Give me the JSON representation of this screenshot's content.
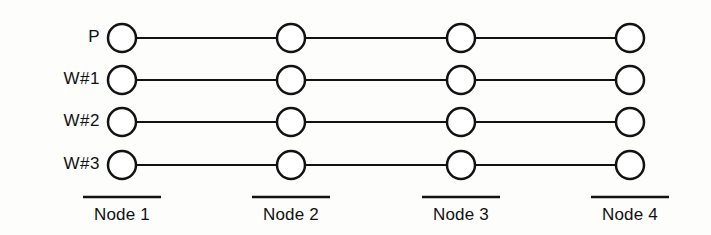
{
  "diagram": {
    "type": "timeline-lanes",
    "background_color": "#fdfdfb",
    "stroke_color": "#121212",
    "node_fill_color": "#ffffff",
    "geometry": {
      "circle_radius": 14,
      "column_x": [
        122,
        291,
        461,
        630
      ],
      "row_y": [
        38,
        80,
        122,
        165
      ],
      "rule_y": 197,
      "rule_half_width": 39,
      "node_label_y": 216
    },
    "rows": [
      {
        "label": "P"
      },
      {
        "label": "W#1"
      },
      {
        "label": "W#2"
      },
      {
        "label": "W#3"
      }
    ],
    "columns": [
      {
        "label": "Node 1"
      },
      {
        "label": "Node 2"
      },
      {
        "label": "Node 3"
      },
      {
        "label": "Node 4"
      }
    ],
    "row_label_x": 100
  }
}
